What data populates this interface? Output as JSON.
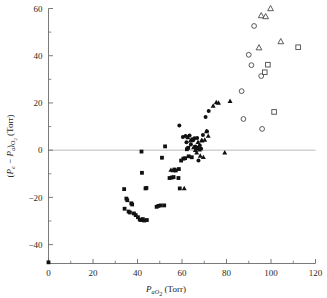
{
  "figure": {
    "background": "#ffffff",
    "point_color": "#111111",
    "open_point_stroke": "#4a4a4a",
    "axis_color": "#6b6b6b",
    "zero_line_color": "#a8a8a8"
  },
  "axes": {
    "x": {
      "label_main": "P",
      "label_sub": "aO",
      "label_sub2": "2",
      "label_units": "(Torr)",
      "label_full": "PaO2 (Torr)",
      "ticks": [
        0,
        20,
        40,
        60,
        80,
        100,
        120
      ],
      "tick_labels": [
        "0",
        "20",
        "40",
        "60",
        "80",
        "100",
        "120"
      ],
      "minor_step": 10,
      "min": 0,
      "max": 120
    },
    "y": {
      "label_full": "(Pe - PaO2) (Torr)",
      "label_p1": "P",
      "label_e": "e",
      "label_minus": "−",
      "label_p2": "P",
      "label_a": "a",
      "label_o2": "O",
      "label_o2sub": "2",
      "label_units": "(Torr)",
      "ticks": [
        -40,
        -20,
        0,
        20,
        40,
        60
      ],
      "tick_labels": [
        "−40",
        "−20",
        "0",
        "20",
        "40",
        "60"
      ],
      "minor_step": 10,
      "min": -48,
      "max": 60
    },
    "zero_reference_line": 0,
    "grid": false
  },
  "chart_data": {
    "type": "scatter",
    "title": "",
    "xlabel": "PaO2 (Torr)",
    "ylabel": "(Pe - Pa)O2 (Torr)",
    "xlim": [
      0,
      120
    ],
    "ylim": [
      -48,
      60
    ],
    "grid": false,
    "legend": "none",
    "series": [
      {
        "name": "filled-square",
        "marker": "square",
        "filled": true,
        "points": [
          [
            34.0,
            -16.5
          ],
          [
            34.2,
            -24.8
          ],
          [
            35.0,
            -20.5
          ],
          [
            35.4,
            -21.2
          ],
          [
            36.0,
            -26.0
          ],
          [
            36.6,
            -26.4
          ],
          [
            37.2,
            -22.5
          ],
          [
            37.6,
            -23.0
          ],
          [
            38.4,
            -26.8
          ],
          [
            39.2,
            -27.5
          ],
          [
            40.2,
            -28.4
          ],
          [
            41.0,
            -29.4
          ],
          [
            41.6,
            -29.6
          ],
          [
            42.0,
            -9.6
          ],
          [
            42.4,
            -29.2
          ],
          [
            43.0,
            -29.8
          ],
          [
            43.6,
            -16.2
          ],
          [
            44.0,
            -16.0
          ],
          [
            44.2,
            -29.6
          ],
          [
            41.8,
            -0.6
          ],
          [
            48.6,
            -24.0
          ],
          [
            49.4,
            -23.6
          ],
          [
            50.4,
            -23.4
          ],
          [
            51.0,
            -3.2
          ],
          [
            52.0,
            -23.4
          ],
          [
            52.4,
            1.6
          ],
          [
            54.4,
            -11.8
          ],
          [
            55.4,
            -11.6
          ],
          [
            56.2,
            -11.4
          ],
          [
            56.6,
            -8.2
          ],
          [
            57.2,
            -8.6
          ],
          [
            58.4,
            -11.8
          ],
          [
            58.6,
            -8.0
          ],
          [
            59.0,
            -16.2
          ],
          [
            59.6,
            -4.4
          ],
          [
            60.6,
            -3.6
          ],
          [
            61.4,
            -3.4
          ],
          [
            62.2,
            0.4
          ],
          [
            62.8,
            1.0
          ],
          [
            63.0,
            -2.6
          ],
          [
            64.4,
            -3.0
          ],
          [
            64.8,
            4.6
          ],
          [
            66.4,
            0.8
          ],
          [
            67.0,
            1.0
          ],
          [
            0.0,
            -47.5
          ]
        ]
      },
      {
        "name": "filled-circle",
        "marker": "circle",
        "filled": true,
        "points": [
          [
            58.8,
            10.4
          ],
          [
            60.4,
            5.6
          ],
          [
            61.6,
            6.0
          ],
          [
            62.0,
            3.4
          ],
          [
            63.4,
            6.2
          ],
          [
            64.0,
            2.4
          ],
          [
            65.0,
            4.2
          ],
          [
            65.6,
            5.0
          ],
          [
            66.0,
            1.6
          ],
          [
            66.8,
            5.2
          ],
          [
            67.4,
            -4.4
          ],
          [
            68.0,
            2.0
          ],
          [
            68.6,
            0.6
          ],
          [
            69.4,
            6.4
          ],
          [
            70.6,
            14.0
          ],
          [
            71.2,
            8.0
          ],
          [
            72.0,
            16.6
          ]
        ]
      },
      {
        "name": "filled-triangle",
        "marker": "triangle",
        "filled": true,
        "points": [
          [
            55.0,
            -8.4
          ],
          [
            56.0,
            -8.6
          ],
          [
            61.0,
            -16.2
          ],
          [
            62.6,
            5.4
          ],
          [
            63.8,
            4.0
          ],
          [
            65.2,
            1.2
          ],
          [
            66.0,
            0.0
          ],
          [
            66.6,
            -1.0
          ],
          [
            67.2,
            3.4
          ],
          [
            67.8,
            0.2
          ],
          [
            68.2,
            -2.4
          ],
          [
            68.8,
            4.2
          ],
          [
            69.0,
            4.0
          ],
          [
            69.6,
            -3.0
          ],
          [
            70.2,
            4.4
          ],
          [
            71.0,
            8.0
          ],
          [
            71.8,
            6.0
          ],
          [
            74.0,
            18.8
          ],
          [
            75.4,
            20.2
          ],
          [
            76.4,
            20.0
          ],
          [
            79.2,
            -1.0
          ],
          [
            81.6,
            20.8
          ]
        ]
      },
      {
        "name": "open-circle",
        "marker": "circle",
        "filled": false,
        "points": [
          [
            86.8,
            25.0
          ],
          [
            87.6,
            13.2
          ],
          [
            90.0,
            40.4
          ],
          [
            91.2,
            36.0
          ],
          [
            92.4,
            52.6
          ],
          [
            95.6,
            31.4
          ],
          [
            96.0,
            9.0
          ]
        ]
      },
      {
        "name": "open-triangle",
        "marker": "triangle",
        "filled": false,
        "points": [
          [
            94.6,
            43.4
          ],
          [
            95.6,
            57.0
          ],
          [
            97.6,
            56.6
          ],
          [
            99.8,
            60.0
          ],
          [
            104.4,
            46.0
          ]
        ]
      },
      {
        "name": "open-square",
        "marker": "square",
        "filled": false,
        "points": [
          [
            97.2,
            33.0
          ],
          [
            98.6,
            36.2
          ],
          [
            101.4,
            16.2
          ],
          [
            112.2,
            43.6
          ]
        ]
      }
    ]
  }
}
